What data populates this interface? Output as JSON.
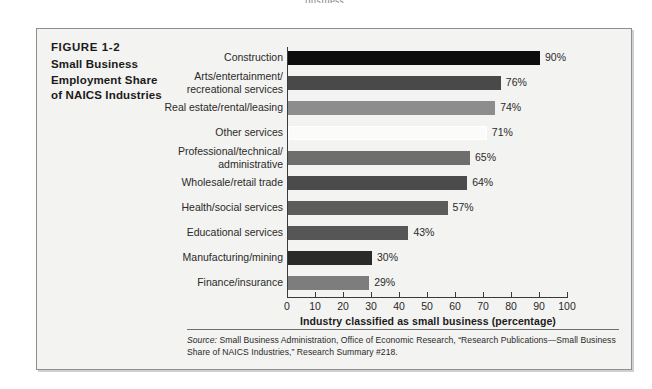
{
  "page": {
    "top_text_fragment": "business."
  },
  "figure": {
    "number_label": "FIGURE 1-2",
    "title_lines": [
      "Small Business",
      "Employment Share",
      "of NAICS Industries"
    ],
    "source_label": "Source:",
    "source_text": " Small Business Administration, Office of Economic Research, “Research Publications—Small Business Share of NAICS Industries,” Research Summary #218."
  },
  "chart_data": {
    "type": "bar",
    "orientation": "horizontal",
    "title": "Small Business Employment Share of NAICS Industries",
    "xlabel": "Industry classified as small business (percentage)",
    "ylabel": "",
    "xlim": [
      0,
      100
    ],
    "grid": false,
    "legend": "none",
    "xticks": [
      0,
      10,
      20,
      30,
      40,
      50,
      60,
      70,
      80,
      90,
      100
    ],
    "xtick_labels": [
      "0",
      "10",
      "20",
      "30",
      "40",
      "50",
      "60",
      "70",
      "80",
      "90",
      "100"
    ],
    "categories": [
      "Construction",
      "Arts/entertainment/ recreational services",
      "Real estate/rental/leasing",
      "Other services",
      "Professional/technical/ administrative",
      "Wholesale/retail trade",
      "Health/social services",
      "Educational services",
      "Manufacturing/mining",
      "Finance/insurance"
    ],
    "category_label_lines": [
      [
        "Construction"
      ],
      [
        "Arts/entertainment/",
        "recreational services"
      ],
      [
        "Real estate/rental/leasing"
      ],
      [
        "Other services"
      ],
      [
        "Professional/technical/",
        "administrative"
      ],
      [
        "Wholesale/retail trade"
      ],
      [
        "Health/social services"
      ],
      [
        "Educational services"
      ],
      [
        "Manufacturing/mining"
      ],
      [
        "Finance/insurance"
      ]
    ],
    "values": [
      90,
      76,
      74,
      71,
      65,
      64,
      57,
      43,
      30,
      29
    ],
    "value_labels": [
      "90%",
      "76%",
      "74%",
      "71%",
      "65%",
      "64%",
      "57%",
      "43%",
      "30%",
      "29%"
    ],
    "bar_colors": [
      "#0d0d0d",
      "#494949",
      "#8d8d8d",
      "#fbfbfa",
      "#6e6e6e",
      "#4b4b4b",
      "#5d5d5d",
      "#565656",
      "#2a2a2a",
      "#7d7d7d"
    ]
  },
  "colors": {
    "box_background": "#f3f3f1",
    "box_border": "#8e8e8e",
    "axis": "#3a3a3a",
    "text": "#2a2a2a"
  }
}
